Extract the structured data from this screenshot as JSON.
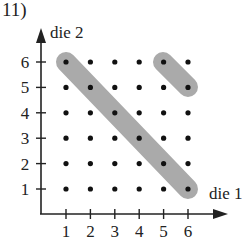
{
  "figure": {
    "label": "11)",
    "y_axis_label": "die 2",
    "x_axis_label": "die 1",
    "x_ticks": [
      "1",
      "2",
      "3",
      "4",
      "5",
      "6"
    ],
    "y_ticks": [
      "1",
      "2",
      "3",
      "4",
      "5",
      "6"
    ],
    "highlight_color": "#aaaaaa",
    "dot_color": "#111111"
  },
  "chart_data": {
    "type": "scatter",
    "title": "11)",
    "xlabel": "die 1",
    "ylabel": "die 2",
    "xlim": [
      1,
      6
    ],
    "ylim": [
      1,
      6
    ],
    "points": "all 36 outcomes (x,y) for x,y in 1..6",
    "highlighted_groups": [
      {
        "name": "sum = 7",
        "points": [
          [
            1,
            6
          ],
          [
            2,
            5
          ],
          [
            3,
            4
          ],
          [
            4,
            3
          ],
          [
            5,
            2
          ],
          [
            6,
            1
          ]
        ]
      },
      {
        "name": "sum = 11",
        "points": [
          [
            5,
            6
          ],
          [
            6,
            5
          ]
        ]
      }
    ]
  }
}
